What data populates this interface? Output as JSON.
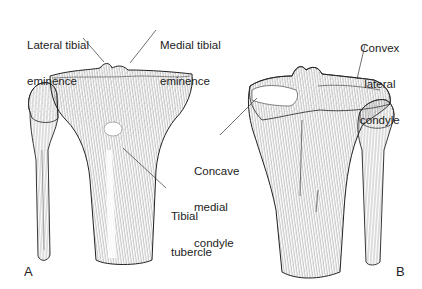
{
  "figure": {
    "panels": [
      {
        "letter": "A",
        "view": "anterior view of proximal tibia and fibula",
        "labels": [
          {
            "id": "lateral-tibial-eminence",
            "lines": [
              "Lateral tibial",
              "eminence"
            ]
          },
          {
            "id": "medial-tibial-eminence",
            "lines": [
              "Medial tibial",
              "eminence"
            ]
          },
          {
            "id": "tibial-tubercle",
            "lines": [
              "Tibial",
              "tubercle"
            ]
          }
        ]
      },
      {
        "letter": "B",
        "view": "posterior view of proximal tibia and fibula",
        "labels": [
          {
            "id": "convex-lateral-condyle",
            "lines": [
              "Convex",
              "lateral",
              "condyle"
            ]
          },
          {
            "id": "concave-medial-condyle",
            "lines": [
              "Concave",
              "medial",
              "condyle"
            ]
          }
        ]
      }
    ],
    "colors": {
      "background": "#ffffff",
      "ink": "#1a1a1a",
      "shading": "#8a8a8a"
    }
  }
}
